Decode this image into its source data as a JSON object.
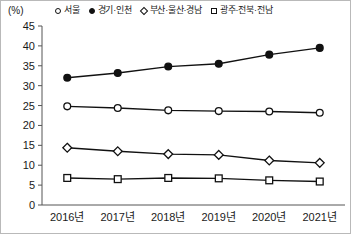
{
  "axis": {
    "unit_label": "(%)",
    "y_ticks": [
      "45",
      "40",
      "35",
      "30",
      "25",
      "20",
      "15",
      "10",
      "5",
      "0"
    ],
    "x_ticks": [
      "2016년",
      "2017년",
      "2018년",
      "2019년",
      "2020년",
      "2021년"
    ]
  },
  "legend": {
    "items": [
      {
        "label": "서울",
        "marker": "open-circle"
      },
      {
        "label": "경기·인천",
        "marker": "filled-circle"
      },
      {
        "label": "부산·울산·경남",
        "marker": "diamond"
      },
      {
        "label": "광주·전북·전남",
        "marker": "square"
      }
    ]
  },
  "chart_data": {
    "type": "line",
    "title": "",
    "xlabel": "",
    "ylabel": "(%)",
    "ylim": [
      0,
      45
    ],
    "y_tick_step": 5,
    "grid": false,
    "legend_position": "top",
    "categories": [
      "2016년",
      "2017년",
      "2018년",
      "2019년",
      "2020년",
      "2021년"
    ],
    "series": [
      {
        "name": "서울",
        "marker": "open-circle",
        "values": [
          24.8,
          24.4,
          23.8,
          23.6,
          23.5,
          23.2
        ]
      },
      {
        "name": "경기·인천",
        "marker": "filled-circle",
        "values": [
          32.0,
          33.2,
          34.8,
          35.5,
          37.8,
          39.5
        ]
      },
      {
        "name": "부산·울산·경남",
        "marker": "diamond",
        "values": [
          14.4,
          13.5,
          12.8,
          12.6,
          11.2,
          10.6
        ]
      },
      {
        "name": "광주·전북·전남",
        "marker": "square",
        "values": [
          6.8,
          6.5,
          6.8,
          6.7,
          6.2,
          5.9
        ]
      }
    ]
  }
}
